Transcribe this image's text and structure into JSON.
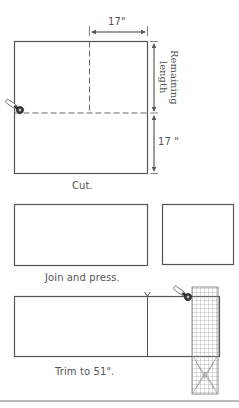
{
  "diagram": {
    "step1": {
      "caption": "Cut.",
      "top_dimension": "17\"",
      "right_dimension_upper": "Remaining length",
      "right_dimension_upper_line1": "Remaining",
      "right_dimension_upper_line2": "length",
      "right_dimension_lower": "17 \""
    },
    "step2": {
      "caption": "Join and press."
    },
    "step3": {
      "caption": "Trim to 51\"."
    },
    "icons": [
      "rotary-cutter-icon",
      "quilting-ruler-icon"
    ],
    "colors": {
      "line": "#555555",
      "dashed": "#666666",
      "text": "#555555",
      "grid": "#777777"
    }
  }
}
